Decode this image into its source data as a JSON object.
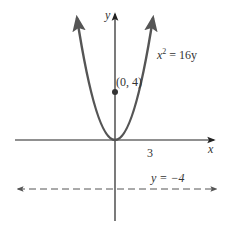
{
  "diagram": {
    "title": "",
    "axes": {
      "x_label": "x",
      "y_label": "y",
      "tick_label_x": "3"
    },
    "curve": {
      "equation_lhs_var": "x",
      "equation_exp": "2",
      "equation_rhs": " = 16y",
      "equation_full": "x^2 = 16y",
      "type": "parabola",
      "vertex": [
        0,
        0
      ]
    },
    "focus": {
      "label": "(0, 4)",
      "point": [
        0,
        4
      ]
    },
    "directrix": {
      "label": "y = −4",
      "style": "dashed",
      "equation": "y = -4"
    },
    "colors": {
      "curve": "#555555",
      "axes": "#222222",
      "directrix": "#555555",
      "text": "#333333"
    }
  }
}
